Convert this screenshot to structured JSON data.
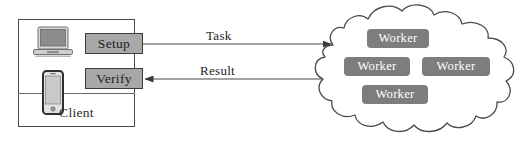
{
  "diagram": {
    "client": {
      "label": "Client",
      "devices": [
        {
          "name": "laptop-icon",
          "label": "laptop"
        },
        {
          "name": "phone-icon",
          "label": "smartphone"
        }
      ],
      "processes": [
        {
          "id": "setup",
          "label": "Setup"
        },
        {
          "id": "verify",
          "label": "Verify"
        }
      ]
    },
    "edges": [
      {
        "id": "task",
        "label": "Task",
        "direction": "client-to-cloud"
      },
      {
        "id": "result",
        "label": "Result",
        "direction": "cloud-to-client"
      }
    ],
    "cloud": {
      "label": "cloud",
      "workers": [
        {
          "label": "Worker"
        },
        {
          "label": "Worker"
        },
        {
          "label": "Worker"
        },
        {
          "label": "Worker"
        }
      ]
    },
    "colors": {
      "process_fill": "#a8a8a8",
      "process_border": "#3c3c3c",
      "worker_fill": "#7d7d7d",
      "worker_text": "#ffffff",
      "line": "#4a4a4a",
      "background": "#ffffff"
    }
  }
}
